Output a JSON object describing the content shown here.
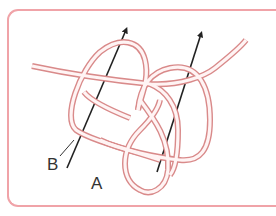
{
  "diagram": {
    "type": "knot-illustration",
    "labels": {
      "a": "A",
      "b": "B"
    },
    "colors": {
      "rope_outline": "#d98a8a",
      "rope_fill": "#fbe3e3",
      "arrow": "#222222",
      "frame": "#f0a3a8"
    },
    "arrows": [
      {
        "name": "arrow-left",
        "direction": "up-right"
      },
      {
        "name": "arrow-right",
        "direction": "up-right"
      }
    ]
  }
}
